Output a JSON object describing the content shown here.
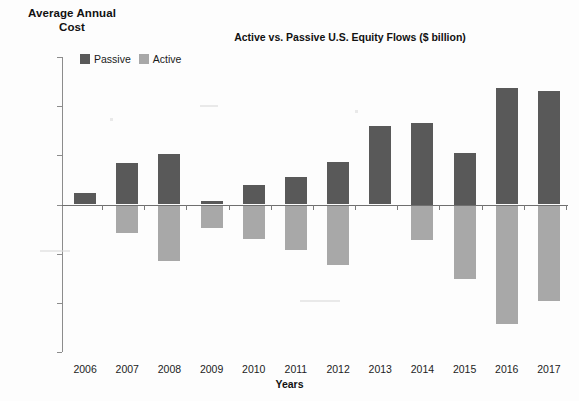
{
  "figure": {
    "y_axis_caption_line1": "Average Annual",
    "y_axis_caption_line2": "Cost",
    "x_axis_caption": "Years"
  },
  "legend": {
    "position": "top-left-inside",
    "entries": [
      {
        "label": "Passive",
        "color": "#595959"
      },
      {
        "label": "Active",
        "color": "#a8a8a8"
      }
    ]
  },
  "chart_data": {
    "type": "bar",
    "title": "Active vs. Passive U.S. Equity Flows ($ billion)",
    "xlabel": "Years",
    "ylabel": "Average Annual Cost",
    "ylim": [
      -300,
      300
    ],
    "yticks": [
      300,
      200,
      100,
      0,
      -100,
      -200,
      -300
    ],
    "ytick_labels": [
      "300",
      "200",
      "100",
      "0",
      "-100",
      "-200",
      "-300"
    ],
    "grid": false,
    "categories": [
      "2006",
      "2007",
      "2008",
      "2009",
      "2010",
      "2011",
      "2012",
      "2013",
      "2014",
      "2015",
      "2016",
      "2017"
    ],
    "series": [
      {
        "name": "Passive",
        "color": "#595959",
        "values": [
          23,
          84,
          103,
          8,
          39,
          55,
          86,
          160,
          165,
          105,
          237,
          230
        ]
      },
      {
        "name": "Active",
        "color": "#a8a8a8",
        "values": [
          0,
          -57,
          -115,
          -47,
          -71,
          -93,
          -124,
          0,
          -72,
          -152,
          -244,
          -196
        ]
      }
    ]
  }
}
